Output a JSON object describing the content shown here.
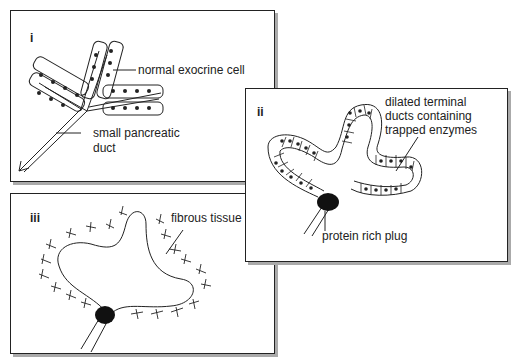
{
  "panels": [
    {
      "id": "i",
      "numeral": "i",
      "labels": {
        "cell": "normal exocrine cell",
        "duct_line1": "small pancreatic",
        "duct_line2": "duct"
      }
    },
    {
      "id": "ii",
      "numeral": "ii",
      "labels": {
        "dilated_line1": "dilated terminal",
        "dilated_line2": "ducts containing",
        "dilated_line3": "trapped enzymes",
        "plug": "protein rich plug"
      }
    },
    {
      "id": "iii",
      "numeral": "iii",
      "labels": {
        "fibrous": "fibrous tissue"
      }
    }
  ],
  "colors": {
    "ink": "#222222",
    "shadow": "#aaaaaa",
    "background": "#ffffff"
  }
}
